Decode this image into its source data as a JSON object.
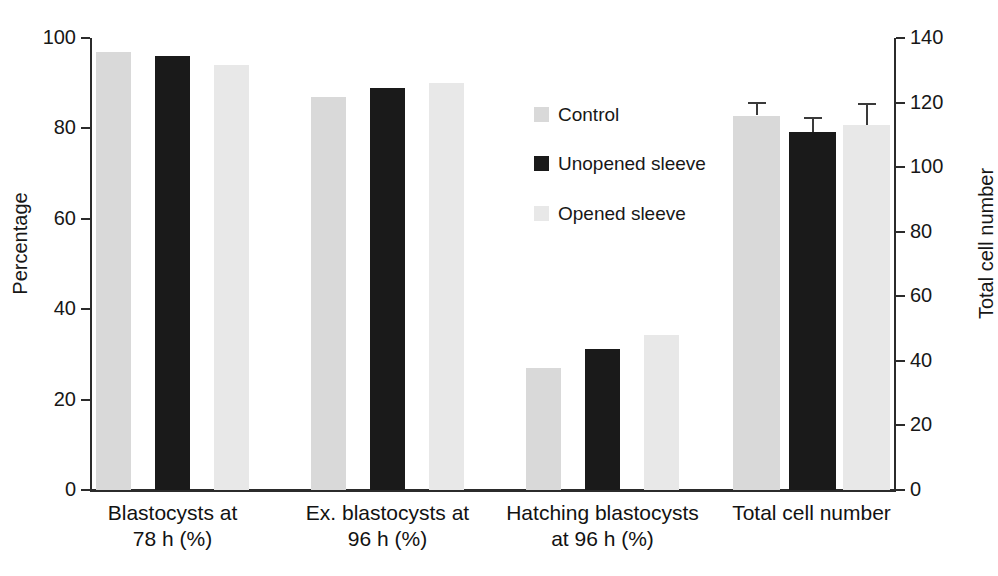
{
  "chart_data": {
    "type": "bar",
    "title": "",
    "categories": [
      "Blastocysts at\n78 h (%)",
      "Ex. blastocysts at\n96 h (%)",
      "Hatching blastocysts\nat 96 h (%)",
      "Total cell number"
    ],
    "category_lines": [
      [
        "Blastocysts at",
        "78 h (%)"
      ],
      [
        "Ex. blastocysts at",
        "96 h (%)"
      ],
      [
        "Hatching blastocysts",
        "at 96 h (%)"
      ],
      [
        "Total cell number",
        ""
      ]
    ],
    "series": [
      {
        "name": "Control",
        "color": "#d9d9d9",
        "values": [
          97,
          87,
          27,
          83
        ],
        "errors": [
          null,
          null,
          null,
          3.0
        ],
        "axis": [
          "left",
          "left",
          "left",
          "right"
        ],
        "right_axis_values": [
          null,
          null,
          null,
          116
        ]
      },
      {
        "name": "Unopened sleeve",
        "color": "#1a1a1a",
        "values": [
          96,
          89,
          31.3,
          79.5
        ],
        "errors": [
          null,
          null,
          null,
          3.3
        ],
        "axis": [
          "left",
          "left",
          "left",
          "right"
        ],
        "right_axis_values": [
          null,
          null,
          null,
          111
        ]
      },
      {
        "name": "Opened sleeve",
        "color": "#e8e8e8",
        "values": [
          94,
          90,
          34.2,
          80.7
        ],
        "errors": [
          null,
          null,
          null,
          5.0
        ],
        "axis": [
          "left",
          "left",
          "left",
          "right"
        ],
        "right_axis_values": [
          null,
          null,
          null,
          113
        ]
      }
    ],
    "xlabel": "",
    "ylabel": "Percentage",
    "ylabel_right": "Total cell number",
    "ylim": [
      0,
      100
    ],
    "ylim_right": [
      0,
      140
    ],
    "yticks": [
      0,
      20,
      40,
      60,
      80,
      100
    ],
    "yticks_right": [
      0,
      20,
      40,
      60,
      80,
      100,
      120,
      140
    ],
    "grid": false,
    "legend_position": "center",
    "legend_entries": [
      "Control",
      "Unopened sleeve",
      "Opened sleeve"
    ],
    "note": "Fourth group 'Total cell number' is plotted against the right-hand axis and carries error bars."
  },
  "axes": {
    "left": {
      "title": "Percentage",
      "ticks": [
        "0",
        "20",
        "40",
        "60",
        "80",
        "100"
      ]
    },
    "right": {
      "title": "Total cell number",
      "ticks": [
        "0",
        "20",
        "40",
        "60",
        "80",
        "100",
        "120",
        "140"
      ]
    }
  },
  "legend": {
    "items": [
      {
        "label": "Control",
        "color": "#d9d9d9"
      },
      {
        "label": "Unopened sleeve",
        "color": "#1a1a1a"
      },
      {
        "label": "Opened sleeve",
        "color": "#e8e8e8"
      }
    ]
  },
  "caption": {
    "partial_text": ""
  }
}
